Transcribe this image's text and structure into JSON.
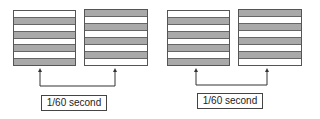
{
  "diagram": {
    "groups": [
      {
        "label": "1/60 second",
        "fields": [
          {
            "name": "field-1",
            "stripes": [
              "w",
              "g",
              "w",
              "g",
              "w",
              "g",
              "w",
              "g"
            ]
          },
          {
            "name": "field-2",
            "stripes": [
              "g",
              "w",
              "g",
              "w",
              "g",
              "w",
              "g",
              "w"
            ]
          }
        ]
      },
      {
        "label": "1/60 second",
        "fields": [
          {
            "name": "field-3",
            "stripes": [
              "w",
              "g",
              "w",
              "g",
              "w",
              "g",
              "w",
              "g"
            ]
          },
          {
            "name": "field-4",
            "stripes": [
              "g",
              "w",
              "g",
              "w",
              "g",
              "w",
              "g",
              "w"
            ]
          }
        ]
      }
    ],
    "colors": {
      "grey_stripe": "#a9a9a9",
      "white_stripe": "#ffffff",
      "outline": "#555555"
    }
  }
}
